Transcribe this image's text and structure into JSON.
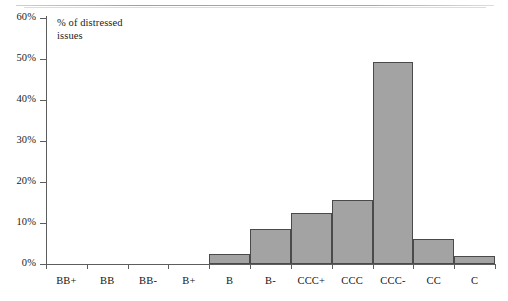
{
  "chart_data": {
    "type": "bar",
    "title": "% of distressed issues",
    "title_lines": [
      "% of distressed",
      "issues"
    ],
    "xlabel": "",
    "ylabel": "",
    "categories": [
      "BB+",
      "BB",
      "BB-",
      "B+",
      "B",
      "B-",
      "CCC+",
      "CCC",
      "CCC-",
      "CC",
      "C"
    ],
    "values": [
      0,
      0,
      0,
      0,
      2.5,
      8.5,
      12.5,
      15.5,
      49.3,
      6.0,
      2.0
    ],
    "ylim": [
      0,
      60
    ],
    "ytick_labels": [
      "0%",
      "10%",
      "20%",
      "30%",
      "40%",
      "50%",
      "60%"
    ],
    "ytick_values": [
      0,
      10,
      20,
      30,
      40,
      50,
      60
    ],
    "grid": false,
    "legend": null,
    "bar_color": "#a3a3a3",
    "bar_border_color": "#4a4a4a",
    "axis_color": "#5d5d5d",
    "background": "#ffffff"
  }
}
